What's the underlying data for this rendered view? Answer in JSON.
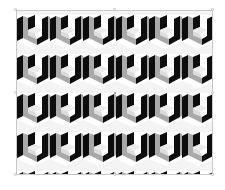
{
  "canvas": {
    "background": "#ffffff"
  },
  "image": {
    "description": "Isometric cube optical-illusion pattern",
    "rows": 4,
    "columns": 6,
    "colors": {
      "dark": "#0d0d0d",
      "mid": "#a9a9a9",
      "light": "#ececec",
      "background": "#ffffff"
    }
  },
  "selection": {
    "handles": [
      "top-left",
      "top-center",
      "top-right",
      "middle-left",
      "middle-right",
      "bottom-left",
      "bottom-center",
      "bottom-right"
    ],
    "frame_color": "#c8c8c8",
    "center_marker": true
  }
}
